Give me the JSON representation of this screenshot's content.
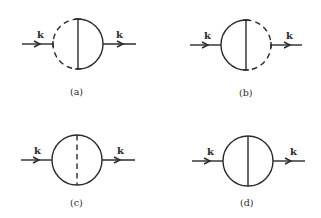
{
  "figure": {
    "panels": [
      {
        "id": "a",
        "label": "(a)",
        "incoming_momentum": "k",
        "outgoing_momentum": "k",
        "left_arc": "dashed",
        "right_arc": "solid",
        "chord": "solid"
      },
      {
        "id": "b",
        "label": "(b)",
        "incoming_momentum": "k",
        "outgoing_momentum": "k",
        "left_arc": "solid",
        "right_arc": "dashed",
        "chord": "solid"
      },
      {
        "id": "c",
        "label": "(c)",
        "incoming_momentum": "k",
        "outgoing_momentum": "k",
        "left_arc": "solid",
        "right_arc": "solid",
        "chord": "dashed"
      },
      {
        "id": "d",
        "label": "(d)",
        "incoming_momentum": "k",
        "outgoing_momentum": "k",
        "left_arc": "solid",
        "right_arc": "solid",
        "chord": "solid"
      }
    ]
  }
}
